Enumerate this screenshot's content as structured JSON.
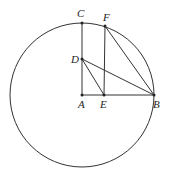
{
  "diagram": {
    "type": "geometry",
    "circle": {
      "center": "A",
      "cx": 82,
      "cy": 95,
      "r": 72
    },
    "points": {
      "A": {
        "label": "A",
        "x": 82,
        "y": 95,
        "lx": 78,
        "ly": 108
      },
      "B": {
        "label": "B",
        "x": 154,
        "y": 95,
        "lx": 153,
        "ly": 108
      },
      "C": {
        "label": "C",
        "x": 82,
        "y": 23,
        "lx": 77,
        "ly": 17
      },
      "D": {
        "label": "D",
        "x": 82,
        "y": 59,
        "lx": 71,
        "ly": 63
      },
      "E": {
        "label": "E",
        "x": 104,
        "y": 95,
        "lx": 100,
        "ly": 108
      },
      "F": {
        "label": "F",
        "x": 105,
        "y": 26,
        "lx": 103,
        "ly": 21
      }
    },
    "segments": [
      [
        "A",
        "C"
      ],
      [
        "A",
        "B"
      ],
      [
        "E",
        "F"
      ],
      [
        "F",
        "B"
      ],
      [
        "D",
        "B"
      ],
      [
        "D",
        "E"
      ]
    ],
    "colors": {
      "stroke": "#333333",
      "point": "#222222",
      "background": "#ffffff"
    }
  }
}
